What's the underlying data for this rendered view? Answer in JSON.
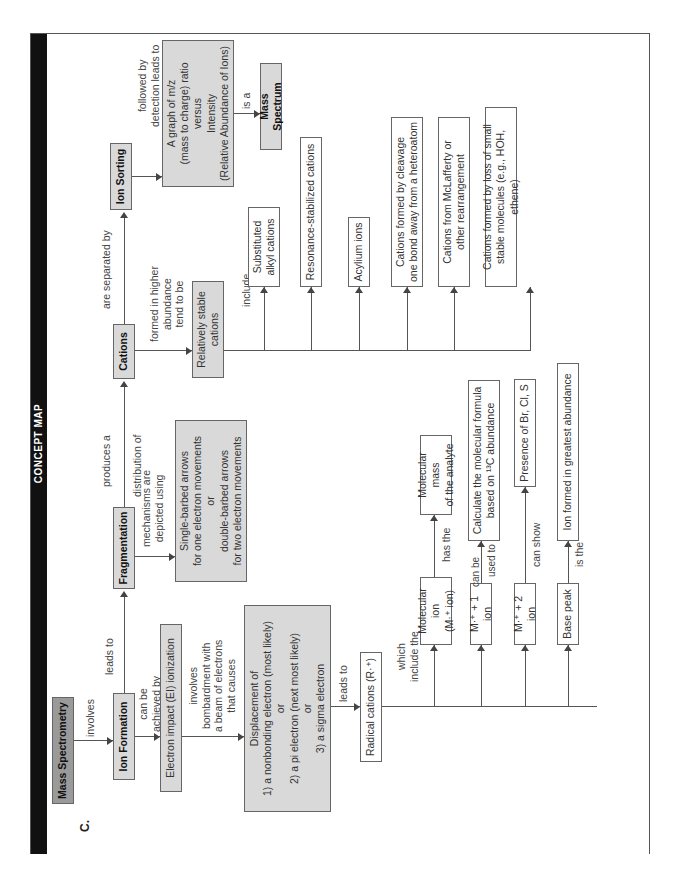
{
  "header": {
    "title": "CONCEPT MAP",
    "section": "C."
  },
  "nodes": {
    "mass_spectrometry": "Mass Spectrometry",
    "ion_formation": "Ion Formation",
    "fragmentation": "Fragmentation",
    "cations": "Cations",
    "ion_sorting": "Ion Sorting",
    "ei_ionization": "Electron impact (EI) ionization",
    "arrows_box": [
      "Single-barbed arrows",
      "for one electron movements",
      "or",
      "double-barbed arrows",
      "for two electron movements"
    ],
    "graph_box": [
      "A graph of m/z",
      "(mass to charge) ratio",
      "versus",
      "Intensity",
      "(Relative Abundance of Ions)"
    ],
    "mass_spectrum": "Mass Spectrum",
    "relatively_stable": [
      "Relatively stable",
      "cations"
    ],
    "displacement_box": [
      "Displacement of",
      "1) a nonbonding electron (most likely)",
      "or",
      "2) a pi electron (next most likely)",
      "or",
      "3) a sigma electron"
    ],
    "radical_cations": "Radical cations (R·⁺)",
    "molecular_ion": [
      "Molecular ion",
      "(M·⁺ ion)"
    ],
    "m_plus_1": "M·⁺ + 1 ion",
    "m_plus_2": "M·⁺ + 2 ion",
    "base_peak": "Base peak",
    "molecular_mass": [
      "Molecular mass",
      "of the analyte"
    ],
    "calc_formula": [
      "Calculate the molecular formula",
      "based on ¹³C abundance"
    ],
    "presence": "Presence of Br, Cl, S",
    "ion_greatest": "Ion formed in greatest abundance",
    "cation_types": [
      [
        "Substituted",
        "alkyl cations"
      ],
      [
        "Resonance-stabilized cations"
      ],
      [
        "Acylium ions"
      ],
      [
        "Cations formed by cleavage",
        "one bond away from a heteroatom"
      ],
      [
        "Cations from McLafferty or",
        "other rearrangement"
      ],
      [
        "Cations formed by loss of small",
        "stable molecules (e.g., HOH, ethene)"
      ]
    ]
  },
  "links": {
    "involves": "involves",
    "leads_to": "leads to",
    "can_be_achieved_by": [
      "can be",
      "achieved by"
    ],
    "produces_a": "produces a",
    "distribution_of": "distribution of",
    "are_separated_by": "are separated by",
    "followed_by": [
      "followed by",
      "detection leads to"
    ],
    "is_a": "is a",
    "mechanisms": [
      "mechanisms are",
      "depicted using"
    ],
    "formed_in_higher": [
      "formed in higher",
      "abundance",
      "tend to be"
    ],
    "include": "include",
    "involves_bombardment": [
      "involves",
      "bombardment with",
      "a beam of electrons",
      "that causes"
    ],
    "leads_to_2": "leads to",
    "which_include": [
      "which",
      "include the"
    ],
    "has_the": "has the",
    "can_be_used_to": [
      "can be",
      "used to"
    ],
    "can_show": "can show",
    "is_the": "is the"
  }
}
